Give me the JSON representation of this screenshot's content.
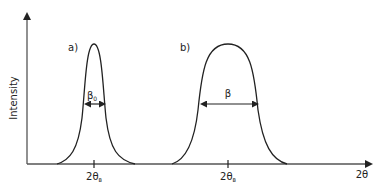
{
  "diagram": {
    "y_axis_label": "Intensity",
    "x_axis_label": "2θ",
    "panels": [
      {
        "label": "a)",
        "width_label": "β",
        "width_subscript": "0",
        "peak_position_label": "2θ",
        "peak_position_subscript": "B",
        "shape": "narrow-peak"
      },
      {
        "label": "b)",
        "width_label": "β",
        "width_subscript": "",
        "peak_position_label": "2θ",
        "peak_position_subscript": "B",
        "shape": "broad-peak"
      }
    ],
    "colors": {
      "line": "#222222",
      "axis": "#555555",
      "background": "#ffffff"
    }
  }
}
